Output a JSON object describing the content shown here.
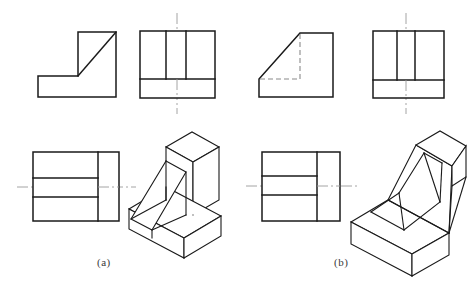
{
  "figure": {
    "type": "engineering-drawing",
    "background_color": "#ffffff",
    "line_color": "#1a1a1a",
    "centerline_color": "#8c8c8c",
    "hidden_line_color": "#8a8a8a",
    "captions": [
      {
        "id": "a",
        "label": "(a)",
        "x": 97,
        "y": 256
      },
      {
        "id": "b",
        "label": "(b)",
        "x": 334,
        "y": 256
      }
    ]
  },
  "groups": [
    {
      "id": "a",
      "label": "(a)",
      "views": [
        {
          "name": "front-view",
          "style": "visible-edges",
          "note": "L-shaped profile with chamfer/diagonal from upper right down to lower left",
          "polyline": "38,97 38,76 78,76 78,32 116,32 116,97 38,97",
          "extra_lines": [
            "78,76 116,32"
          ]
        },
        {
          "name": "side-view",
          "style": "visible-edges-with-centerline",
          "outline": "140,31 215,31 215,98 140,98 140,31",
          "inner_vertical_lines": [
            "166,31 166,79",
            "186,31 186,79"
          ],
          "inner_horizontal_lines": [
            "140,79 215,79"
          ],
          "centerline": "177,14 177,113"
        },
        {
          "name": "top-view",
          "style": "visible-edges-with-centerline",
          "outline": "33,152 119,152 119,221 33,221 33,152",
          "inner_vertical_lines": [
            "98,152 98,221"
          ],
          "inner_horizontal_lines": [
            "33,178 98,178",
            "33,197 98,197"
          ],
          "centerline": "18,187 134,187"
        },
        {
          "name": "isometric-view",
          "style": "pictorial",
          "note": "Angled bracket with triangular web rib rising from base plate"
        }
      ]
    },
    {
      "id": "b",
      "label": "(b)",
      "views": [
        {
          "name": "front-view",
          "style": "visible-edges-with-hidden-lines",
          "note": "Solid triangular wedge outline with hidden L-shaped internal edges shown dashed",
          "polyline": "259,97 259,79 300,79 300,33 333,33 333,97 259,97",
          "outer_solid": "259,79 300,33",
          "hidden_lines": [
            "300,33 300,79",
            "259,79 300,79"
          ]
        },
        {
          "name": "side-view",
          "style": "visible-edges-with-centerline",
          "outline": "373,31 444,31 444,98 373,98 373,31",
          "inner_vertical_lines": [
            "397,31 397,80",
            "415,31 415,80"
          ],
          "inner_horizontal_lines": [
            "373,80 444,80"
          ],
          "centerline": "406,14 406,113"
        },
        {
          "name": "top-view",
          "style": "visible-edges-with-centerline",
          "outline": "262,152 340,152 340,221 262,221 262,152",
          "inner_vertical_lines": [
            "317,152 317,221"
          ],
          "inner_horizontal_lines": [
            "262,176 317,176",
            "262,195 317,195"
          ],
          "centerline": "246,186 356,186"
        },
        {
          "name": "isometric-view",
          "style": "pictorial",
          "note": "Inclined ramp wedge with sloping top face and internal channel"
        }
      ]
    }
  ]
}
